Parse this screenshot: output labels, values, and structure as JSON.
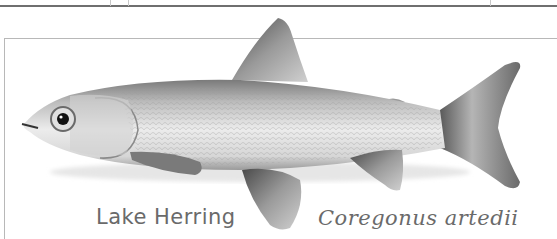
{
  "illustration": {
    "subject": "fish",
    "common_name": "Lake Herring",
    "scientific_name": "Coregonus artedii",
    "palette": {
      "background": "#ffffff",
      "frame": "#b8b8b8",
      "rule": "#6f6f6f",
      "body_light": "#e8e8e8",
      "body_mid": "#bdbdbd",
      "fin_dark": "#5a5a5a",
      "caption": "#6a6a6a"
    }
  }
}
